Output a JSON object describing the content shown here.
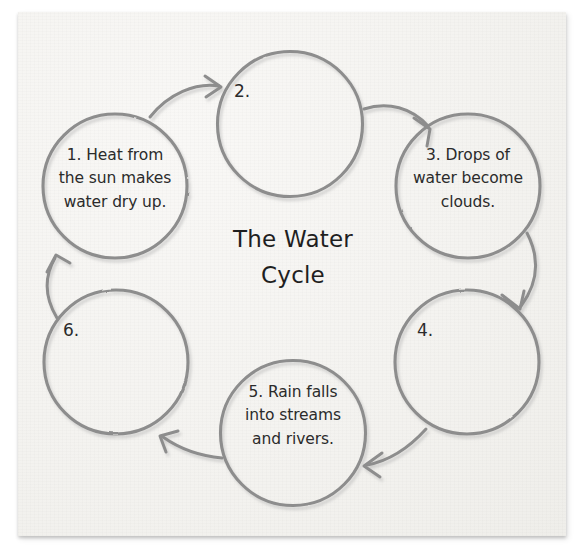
{
  "sheet": {
    "paper_color": "#f4f3f0",
    "ink_color": "#2b2b2b",
    "stroke_color": "#8a8a8a"
  },
  "title": "The Water\nCycle",
  "diagram": {
    "type": "cycle",
    "direction": "clockwise",
    "node_count": 6,
    "nodes": [
      {
        "number": "1.",
        "label": "1. Heat from\nthe sun makes\nwater dry up.",
        "filled": true,
        "position": "top-left"
      },
      {
        "number": "2.",
        "label": "2.",
        "filled": false,
        "position": "top-center"
      },
      {
        "number": "3.",
        "label": "3. Drops of\nwater become\nclouds.",
        "filled": true,
        "position": "top-right"
      },
      {
        "number": "4.",
        "label": "4.",
        "filled": false,
        "position": "bottom-right"
      },
      {
        "number": "5.",
        "label": "5. Rain falls\ninto streams\nand rivers.",
        "filled": true,
        "position": "bottom-center"
      },
      {
        "number": "6.",
        "label": "6.",
        "filled": false,
        "position": "bottom-left"
      }
    ],
    "arrows": [
      {
        "from": "1",
        "to": "2"
      },
      {
        "from": "2",
        "to": "3"
      },
      {
        "from": "3",
        "to": "4"
      },
      {
        "from": "4",
        "to": "5"
      },
      {
        "from": "5",
        "to": "6"
      },
      {
        "from": "6",
        "to": "1"
      }
    ]
  }
}
